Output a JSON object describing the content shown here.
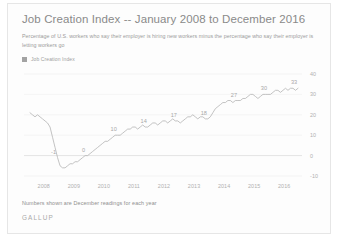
{
  "card": {
    "title": "Job Creation Index -- January 2008 to December 2016",
    "subtitle": "Percentage of U.S. workers who say their employer is hiring new workers minus the percentage who say their employer is letting workers go",
    "footnote": "Numbers shown are December readings for each year",
    "brand": "GALLUP",
    "legend_label": "Job Creation Index",
    "accent_color": "#a3a3a3",
    "line_color": "#b4b4b4",
    "grid_color": "#efefef",
    "text_color": "#9b9b9b"
  },
  "chart_data": {
    "type": "line",
    "title": "Job Creation Index -- January 2008 to December 2016",
    "subtitle": "Percentage of U.S. workers who say their employer is hiring new workers minus the percentage who say their employer is letting workers go",
    "xlabel": "",
    "ylabel": "",
    "ylim": [
      -10,
      40
    ],
    "yticks": [
      -10,
      0,
      10,
      20,
      30,
      40
    ],
    "xticks": [
      "2008",
      "2009",
      "2010",
      "2011",
      "2012",
      "2013",
      "2014",
      "2015",
      "2016"
    ],
    "grid": true,
    "legend": [
      "Job Creation Index"
    ],
    "legend_position": "top-left",
    "annotation": "Numbers shown are December readings for each year",
    "point_labels": [
      {
        "x": "2008-12",
        "value": -1,
        "text": "-1"
      },
      {
        "x": "2009-12",
        "value": 0,
        "text": "0"
      },
      {
        "x": "2010-12",
        "value": 10,
        "text": "10"
      },
      {
        "x": "2011-12",
        "value": 14,
        "text": "14"
      },
      {
        "x": "2012-12",
        "value": 17,
        "text": "17"
      },
      {
        "x": "2013-12",
        "value": 18,
        "text": "18"
      },
      {
        "x": "2014-12",
        "value": 27,
        "text": "27"
      },
      {
        "x": "2015-12",
        "value": 30,
        "text": "30"
      },
      {
        "x": "2016-12",
        "value": 33,
        "text": "33"
      }
    ],
    "series": [
      {
        "name": "Job Creation Index",
        "values": [
          21,
          20,
          19,
          20,
          19,
          18,
          17,
          16,
          14,
          9,
          4,
          -1,
          -5,
          -6,
          -6,
          -5,
          -4,
          -4,
          -3,
          -3,
          -2,
          -1,
          0,
          0,
          1,
          2,
          3,
          4,
          5,
          6,
          7,
          7,
          8,
          9,
          10,
          10,
          10,
          11,
          12,
          13,
          13,
          14,
          14,
          13,
          14,
          15,
          14,
          14,
          15,
          16,
          16,
          15,
          16,
          17,
          17,
          16,
          17,
          18,
          17,
          17,
          16,
          17,
          18,
          19,
          19,
          20,
          19,
          18,
          19,
          19,
          18,
          18,
          19,
          21,
          23,
          24,
          25,
          26,
          26,
          27,
          27,
          26,
          27,
          27,
          27,
          28,
          28,
          29,
          30,
          30,
          29,
          28,
          29,
          30,
          30,
          30,
          30,
          31,
          32,
          32,
          31,
          32,
          33,
          32,
          33,
          33,
          32,
          33
        ]
      }
    ]
  }
}
